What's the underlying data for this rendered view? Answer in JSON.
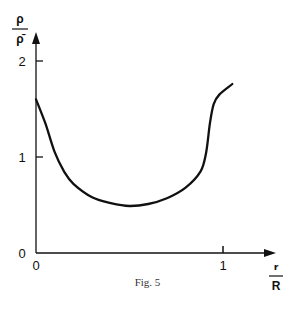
{
  "figure": {
    "caption": "Fig. 5"
  },
  "colors": {
    "line": "#111111",
    "axis": "#111111",
    "background": "#ffffff"
  },
  "chart_data": {
    "type": "line",
    "title": "",
    "xlabel": "r/R",
    "xlabel_num": "r",
    "xlabel_den": "R",
    "ylabel": "ρ/ρ̄",
    "ylabel_num": "ρ",
    "ylabel_den": "ρ̄",
    "xlim": [
      0,
      1.15
    ],
    "ylim": [
      0,
      2.3
    ],
    "x_ticks": [
      {
        "value": 0,
        "label": "0"
      },
      {
        "value": 1,
        "label": "1"
      }
    ],
    "y_ticks": [
      {
        "value": 0,
        "label": "0"
      },
      {
        "value": 1,
        "label": "1"
      },
      {
        "value": 2,
        "label": "2"
      }
    ],
    "grid": false,
    "legend": null,
    "series": [
      {
        "name": "density profile",
        "x": [
          0,
          0.05,
          0.1,
          0.15,
          0.2,
          0.3,
          0.4,
          0.5,
          0.6,
          0.7,
          0.8,
          0.88,
          0.91,
          0.93,
          0.95,
          0.98,
          1.05
        ],
        "y": [
          1.6,
          1.35,
          1.05,
          0.85,
          0.72,
          0.58,
          0.52,
          0.49,
          0.51,
          0.57,
          0.68,
          0.85,
          1.05,
          1.35,
          1.55,
          1.65,
          1.76
        ]
      }
    ]
  }
}
